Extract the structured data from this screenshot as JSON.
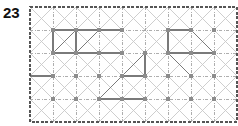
{
  "figure": {
    "label": "23",
    "type": "lattice-grid-puzzle",
    "caption": ""
  },
  "colors": {
    "label_text": "#111111",
    "background": "#ffffff",
    "grid_dotted": "#9a9a9a",
    "grid_border": "#555555",
    "diagonal_light": "#c9c9c9",
    "solid_path": "#7a7a7a",
    "node_fill": "#8c8c8c"
  },
  "lattice": {
    "origin_x": 30,
    "origin_y": 7,
    "cell": 23,
    "cols": 9,
    "rows": 5,
    "width": 207,
    "height": 115,
    "show_diagonals": true,
    "show_nodes": true,
    "border_style": "dashed",
    "grid_style": "dash-dot"
  },
  "chart_data": {
    "type": "scatter",
    "title": "23",
    "xlabel": "",
    "ylabel": "",
    "xlim": [
      0,
      9
    ],
    "ylim": [
      0,
      5
    ],
    "grid": true,
    "legend": null,
    "annotations": [],
    "nodes": [
      {
        "c": 1,
        "r": 1
      },
      {
        "c": 2,
        "r": 1
      },
      {
        "c": 3,
        "r": 1
      },
      {
        "c": 4,
        "r": 1
      },
      {
        "c": 6,
        "r": 1
      },
      {
        "c": 7,
        "r": 1
      },
      {
        "c": 8,
        "r": 1
      },
      {
        "c": 1,
        "r": 2
      },
      {
        "c": 2,
        "r": 2
      },
      {
        "c": 3,
        "r": 2
      },
      {
        "c": 4,
        "r": 2
      },
      {
        "c": 5,
        "r": 2
      },
      {
        "c": 6,
        "r": 2
      },
      {
        "c": 7,
        "r": 2
      },
      {
        "c": 8,
        "r": 2
      },
      {
        "c": 1,
        "r": 3
      },
      {
        "c": 2,
        "r": 3
      },
      {
        "c": 3,
        "r": 3
      },
      {
        "c": 4,
        "r": 3
      },
      {
        "c": 5,
        "r": 3
      },
      {
        "c": 6,
        "r": 3
      },
      {
        "c": 7,
        "r": 3
      },
      {
        "c": 8,
        "r": 3
      },
      {
        "c": 1,
        "r": 4
      },
      {
        "c": 2,
        "r": 4
      },
      {
        "c": 3,
        "r": 4
      },
      {
        "c": 4,
        "r": 4
      },
      {
        "c": 5,
        "r": 4
      },
      {
        "c": 6,
        "r": 4
      },
      {
        "c": 7,
        "r": 4
      },
      {
        "c": 8,
        "r": 4
      }
    ],
    "solid_segments": [
      {
        "x1": 1,
        "y1": 1,
        "x2": 4,
        "y2": 1
      },
      {
        "x1": 1,
        "y1": 1,
        "x2": 1,
        "y2": 2
      },
      {
        "x1": 2,
        "y1": 1,
        "x2": 2,
        "y2": 2
      },
      {
        "x1": 1,
        "y1": 2,
        "x2": 4,
        "y2": 2
      },
      {
        "x1": 1,
        "y1": 2,
        "x2": 2,
        "y2": 1
      },
      {
        "x1": 2,
        "y1": 2,
        "x2": 3,
        "y2": 1
      },
      {
        "x1": 6,
        "y1": 1,
        "x2": 6,
        "y2": 2
      },
      {
        "x1": 6,
        "y1": 2,
        "x2": 8,
        "y2": 2
      },
      {
        "x1": 7,
        "y1": 1,
        "x2": 8,
        "y2": 2
      },
      {
        "x1": 6,
        "y1": 1,
        "x2": 7,
        "y2": 1
      },
      {
        "x1": 5,
        "y1": 2,
        "x2": 5,
        "y2": 3
      },
      {
        "x1": 4,
        "y1": 3,
        "x2": 5,
        "y2": 3
      },
      {
        "x1": 4,
        "y1": 3,
        "x2": 5,
        "y2": 2
      },
      {
        "x1": 3,
        "y1": 4,
        "x2": 5,
        "y2": 4
      },
      {
        "x1": 3,
        "y1": 4,
        "x2": 5,
        "y2": 2
      },
      {
        "x1": 6,
        "y1": 2,
        "x2": 7,
        "y2": 3
      },
      {
        "x1": 0,
        "y1": 3,
        "x2": 1,
        "y2": 3
      }
    ]
  }
}
